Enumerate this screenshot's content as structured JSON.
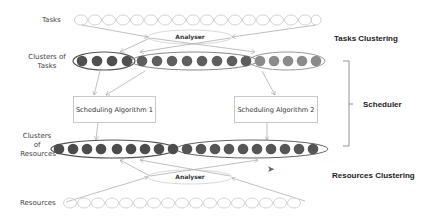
{
  "labels": {
    "tasks": "Tasks",
    "clusters_of_tasks": "Clusters of Tasks",
    "clusters_of_resources_1": "Clusters",
    "clusters_of_resources_2": "of",
    "clusters_of_resources_3": "Resources",
    "resources": "Resources"
  },
  "analysers": {
    "top": "Analyser",
    "bottom": "Analyser"
  },
  "algorithms": {
    "one": "Scheduling Algorithm 1",
    "two": "Scheduling Algorithm 2"
  },
  "sections": {
    "tasks_clustering": "Tasks Clustering",
    "scheduler": "Scheduler",
    "resources_clustering": "Resources Clustering"
  },
  "colors": {
    "dark_node": "#555555",
    "mid_node": "#7a7a7a",
    "light_node": "#9a9a9a",
    "empty_node": "#d9d9d9",
    "cluster_outline": "#666666"
  },
  "counts": {
    "tasks": 18,
    "task_clusters": [
      4,
      8,
      5
    ],
    "resource_clusters": [
      9,
      10
    ],
    "resources": 17
  }
}
